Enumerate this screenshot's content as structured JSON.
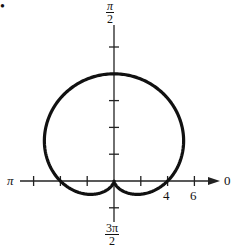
{
  "chart_data": {
    "type": "line",
    "subtype": "polar",
    "title": "",
    "equation_depicted": "r = 4(1 + sin θ)",
    "angle_labels": {
      "right": "0",
      "top": "π/2",
      "left": "π",
      "bottom": "3π/2"
    },
    "angle_label_parts": {
      "top": {
        "num": "π",
        "den": "2"
      },
      "bottom": {
        "num": "3π",
        "den": "2"
      },
      "left": "π",
      "right": "0"
    },
    "radial_tick_labels": [
      "4",
      "6"
    ],
    "radial_tick_step": 2,
    "axis_range": {
      "x": [
        -8,
        8
      ],
      "y": [
        -2,
        10
      ]
    },
    "grid": false,
    "series": [
      {
        "name": "curve",
        "r_const": 4,
        "r_sin_coeff": 4,
        "theta_range": [
          0,
          6.2832
        ]
      }
    ],
    "key_points": [
      {
        "theta": "π/2",
        "r": 8
      },
      {
        "theta": "0",
        "r": 4
      },
      {
        "theta": "π",
        "r": 4
      },
      {
        "theta": "3π/2",
        "r": 0
      }
    ]
  },
  "bullet": "•"
}
